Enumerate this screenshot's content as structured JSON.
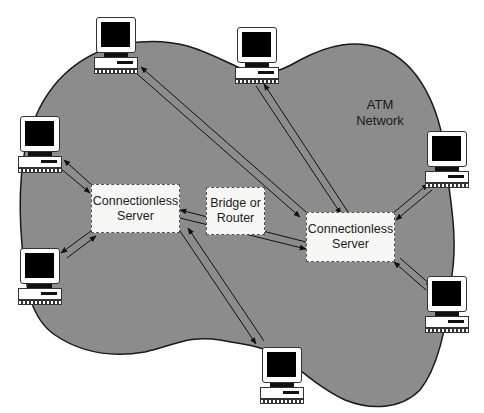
{
  "diagram": {
    "type": "network-topology",
    "cloud": {
      "label_line1": "ATM",
      "label_line2": "Network",
      "fill": "#8a8a8a",
      "stroke": "#1a1a1a"
    },
    "servers": [
      {
        "id": "cls-left",
        "line1": "Connectionless",
        "line2": "Server"
      },
      {
        "id": "cls-right",
        "line1": "Connectionless",
        "line2": "Server"
      }
    ],
    "bridge": {
      "line1": "Bridge or",
      "line2": "Router"
    },
    "workstations": [
      {
        "id": "pc-top-left"
      },
      {
        "id": "pc-top-center"
      },
      {
        "id": "pc-left-upper"
      },
      {
        "id": "pc-left-lower"
      },
      {
        "id": "pc-bottom-center"
      },
      {
        "id": "pc-right-upper"
      },
      {
        "id": "pc-right-lower"
      }
    ],
    "links": [
      {
        "from": "pc-top-left",
        "to": "cls-right",
        "bidirectional": true
      },
      {
        "from": "pc-top-center",
        "to": "cls-right",
        "bidirectional": true
      },
      {
        "from": "pc-left-upper",
        "to": "cls-left",
        "bidirectional": true
      },
      {
        "from": "pc-left-lower",
        "to": "cls-left",
        "bidirectional": true
      },
      {
        "from": "cls-left",
        "to": "pc-bottom-center",
        "bidirectional": true
      },
      {
        "from": "cls-left",
        "to": "cls-right",
        "via": "bridge",
        "bidirectional": true
      },
      {
        "from": "cls-right",
        "to": "pc-right-upper",
        "bidirectional": true
      },
      {
        "from": "cls-right",
        "to": "pc-right-lower",
        "bidirectional": true
      }
    ]
  }
}
